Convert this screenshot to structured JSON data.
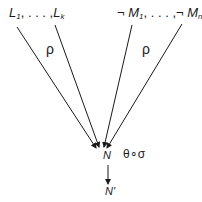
{
  "diagram": {
    "top_left": {
      "first": "L",
      "first_sub": "1",
      "ellipsis": ", . . . ,",
      "last": "L",
      "last_sub": "k"
    },
    "top_right": {
      "neg1": "¬",
      "first": "M",
      "first_sub": "1",
      "ellipsis": ", . . . ,",
      "neg2": "¬",
      "last": "M",
      "last_sub": "n"
    },
    "left_edge_label": "ρ",
    "right_edge_label": "ρ",
    "center_node": "N",
    "bottom_node": "N'",
    "down_edge_label": "θ∘σ",
    "colors": {
      "ink": "#1a1a1a",
      "background": "#ffffff"
    }
  }
}
